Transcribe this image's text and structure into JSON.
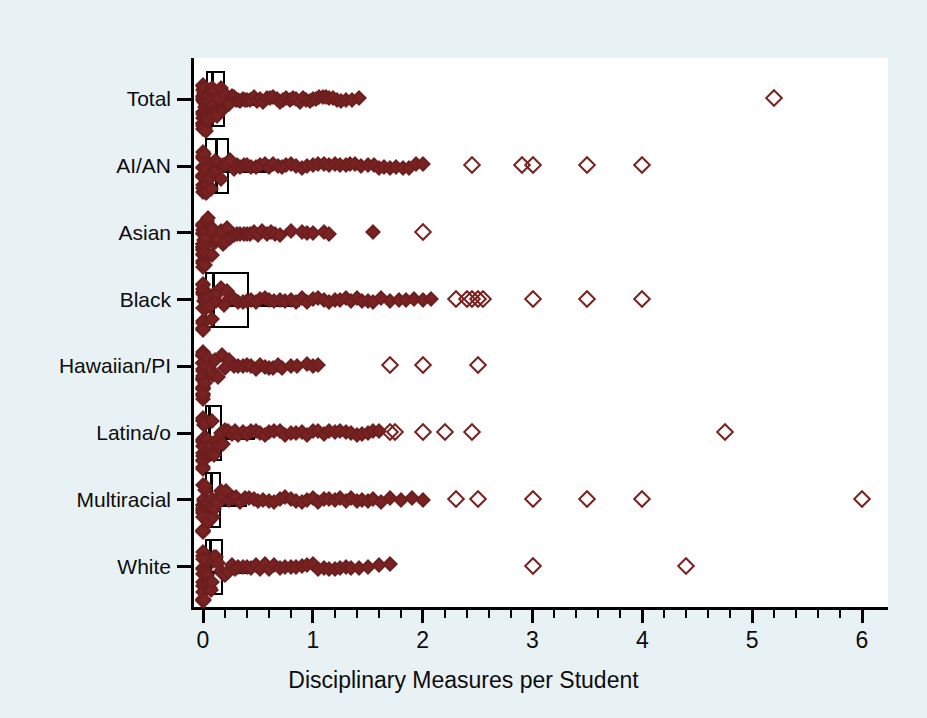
{
  "figure": {
    "background_color": "#e8f1f3",
    "panel_color": "#ffffff",
    "marker_color": "#7a2222",
    "axis_color": "#000000"
  },
  "chart_data": {
    "type": "box",
    "title": "",
    "subtitle": "",
    "xlabel": "Disciplinary Measures per Student",
    "ylabel": "",
    "xlim": [
      0,
      6
    ],
    "xticks": [
      0,
      1,
      2,
      3,
      4,
      5,
      6
    ],
    "xticklabels": [
      "0",
      "1",
      "2",
      "3",
      "4",
      "5",
      "6"
    ],
    "minor_tick_step": 0.2,
    "grid": false,
    "legend": null,
    "orientation": "horizontal",
    "categories": [
      "Total",
      "AI/AN",
      "Asian",
      "Black",
      "Hawaiian/PI",
      "Latina/o",
      "Multiracial",
      "White"
    ],
    "series": [
      {
        "name": "Total",
        "q1": 0.03,
        "median": 0.09,
        "q3": 0.2,
        "whisker_low": 0.0,
        "whisker_high": 0.46,
        "box_visible": true,
        "points": [
          0.0,
          0.0,
          0.0,
          0.0,
          0.0,
          0.0,
          0.0,
          0.0,
          0.0,
          0.0,
          0.0,
          0.0,
          0.0,
          0.0,
          0.01,
          0.01,
          0.01,
          0.01,
          0.01,
          0.01,
          0.02,
          0.02,
          0.02,
          0.02,
          0.03,
          0.03,
          0.03,
          0.03,
          0.04,
          0.04,
          0.04,
          0.05,
          0.05,
          0.05,
          0.06,
          0.06,
          0.07,
          0.07,
          0.08,
          0.08,
          0.09,
          0.09,
          0.1,
          0.1,
          0.11,
          0.12,
          0.13,
          0.14,
          0.15,
          0.16,
          0.17,
          0.18,
          0.19,
          0.2,
          0.21,
          0.22,
          0.24,
          0.26,
          0.28,
          0.3,
          0.32,
          0.34,
          0.36,
          0.38,
          0.4,
          0.43,
          0.46,
          0.49,
          0.52,
          0.55,
          0.58,
          0.61,
          0.64,
          0.67,
          0.7,
          0.73,
          0.76,
          0.79,
          0.82,
          0.85,
          0.88,
          0.91,
          0.94,
          0.97,
          1.0,
          1.03,
          1.06,
          1.09,
          1.12,
          1.15,
          1.18,
          1.22,
          1.26,
          1.3,
          1.36,
          1.42,
          5.2
        ],
        "outliers_far": [
          5.2
        ]
      },
      {
        "name": "AI/AN",
        "q1": 0.02,
        "median": 0.12,
        "q3": 0.24,
        "whisker_low": 0.0,
        "whisker_high": 0.62,
        "box_visible": true,
        "points": [
          0.0,
          0.0,
          0.0,
          0.0,
          0.0,
          0.0,
          0.0,
          0.0,
          0.0,
          0.0,
          0.0,
          0.0,
          0.01,
          0.01,
          0.01,
          0.02,
          0.02,
          0.03,
          0.03,
          0.04,
          0.05,
          0.06,
          0.07,
          0.08,
          0.09,
          0.1,
          0.11,
          0.12,
          0.14,
          0.16,
          0.18,
          0.2,
          0.22,
          0.25,
          0.28,
          0.31,
          0.34,
          0.37,
          0.4,
          0.44,
          0.48,
          0.52,
          0.56,
          0.6,
          0.64,
          0.68,
          0.72,
          0.76,
          0.8,
          0.85,
          0.9,
          0.95,
          1.0,
          1.05,
          1.1,
          1.15,
          1.2,
          1.25,
          1.3,
          1.34,
          1.38,
          1.44,
          1.5,
          1.56,
          1.6,
          1.65,
          1.7,
          1.76,
          1.82,
          1.88,
          1.94,
          2.0,
          2.45,
          2.9,
          3.0,
          3.5,
          4.0
        ],
        "outliers_far": [
          2.45,
          2.9,
          3.0,
          3.5,
          4.0
        ]
      },
      {
        "name": "Asian",
        "q1": 0.0,
        "median": 0.01,
        "q3": 0.03,
        "whisker_low": 0.0,
        "whisker_high": 0.07,
        "box_visible": false,
        "points": [
          0.0,
          0.0,
          0.0,
          0.0,
          0.0,
          0.0,
          0.0,
          0.0,
          0.0,
          0.0,
          0.0,
          0.0,
          0.0,
          0.0,
          0.0,
          0.0,
          0.0,
          0.01,
          0.01,
          0.01,
          0.01,
          0.02,
          0.02,
          0.03,
          0.04,
          0.05,
          0.06,
          0.07,
          0.08,
          0.09,
          0.1,
          0.12,
          0.14,
          0.16,
          0.18,
          0.2,
          0.22,
          0.25,
          0.28,
          0.31,
          0.34,
          0.37,
          0.4,
          0.43,
          0.46,
          0.5,
          0.54,
          0.58,
          0.62,
          0.66,
          0.7,
          0.8,
          0.9,
          0.95,
          1.0,
          1.1,
          1.15,
          1.55,
          2.0
        ],
        "outliers_far": [
          0.8,
          0.9,
          0.95,
          1.0,
          1.1,
          1.15,
          1.55,
          2.0
        ]
      },
      {
        "name": "Black",
        "q1": 0.02,
        "median": 0.1,
        "q3": 0.42,
        "whisker_low": 0.0,
        "whisker_high": 0.88,
        "box_visible": true,
        "points": [
          0.0,
          0.0,
          0.0,
          0.0,
          0.0,
          0.0,
          0.0,
          0.0,
          0.0,
          0.0,
          0.0,
          0.01,
          0.01,
          0.02,
          0.03,
          0.04,
          0.05,
          0.06,
          0.08,
          0.1,
          0.12,
          0.14,
          0.16,
          0.19,
          0.22,
          0.25,
          0.28,
          0.32,
          0.36,
          0.4,
          0.44,
          0.48,
          0.52,
          0.56,
          0.6,
          0.65,
          0.7,
          0.75,
          0.8,
          0.85,
          0.9,
          0.95,
          1.0,
          1.05,
          1.1,
          1.15,
          1.2,
          1.25,
          1.3,
          1.35,
          1.4,
          1.45,
          1.5,
          1.55,
          1.62,
          1.7,
          1.78,
          1.85,
          1.92,
          2.0,
          2.08,
          2.3,
          2.4,
          2.45,
          2.5,
          2.55,
          3.0,
          3.5,
          4.0
        ],
        "outliers_far": [
          2.3,
          2.4,
          2.45,
          2.5,
          2.55,
          3.0,
          3.5,
          4.0
        ]
      },
      {
        "name": "Hawaiian/PI",
        "q1": 0.0,
        "median": 0.0,
        "q3": 0.02,
        "whisker_low": 0.0,
        "whisker_high": 0.04,
        "box_visible": false,
        "points": [
          0.0,
          0.0,
          0.0,
          0.0,
          0.0,
          0.0,
          0.0,
          0.0,
          0.0,
          0.0,
          0.0,
          0.0,
          0.0,
          0.0,
          0.0,
          0.0,
          0.0,
          0.0,
          0.0,
          0.0,
          0.0,
          0.0,
          0.01,
          0.02,
          0.03,
          0.05,
          0.07,
          0.09,
          0.11,
          0.14,
          0.17,
          0.2,
          0.24,
          0.28,
          0.32,
          0.36,
          0.4,
          0.44,
          0.48,
          0.52,
          0.56,
          0.6,
          0.64,
          0.68,
          0.72,
          0.8,
          0.86,
          0.95,
          1.0,
          1.05,
          1.7,
          2.0,
          2.5
        ],
        "outliers_far": [
          0.8,
          0.86,
          0.95,
          1.0,
          1.05,
          1.7,
          2.0,
          2.5
        ]
      },
      {
        "name": "Latina/o",
        "q1": 0.02,
        "median": 0.06,
        "q3": 0.17,
        "whisker_low": 0.0,
        "whisker_high": 0.47,
        "box_visible": true,
        "points": [
          0.0,
          0.0,
          0.0,
          0.0,
          0.0,
          0.0,
          0.0,
          0.0,
          0.0,
          0.0,
          0.0,
          0.0,
          0.0,
          0.01,
          0.01,
          0.01,
          0.02,
          0.02,
          0.03,
          0.03,
          0.04,
          0.05,
          0.06,
          0.07,
          0.08,
          0.09,
          0.1,
          0.12,
          0.14,
          0.16,
          0.18,
          0.2,
          0.23,
          0.26,
          0.29,
          0.32,
          0.36,
          0.4,
          0.44,
          0.48,
          0.52,
          0.56,
          0.6,
          0.65,
          0.7,
          0.75,
          0.8,
          0.85,
          0.9,
          0.95,
          1.0,
          1.05,
          1.1,
          1.15,
          1.2,
          1.25,
          1.3,
          1.35,
          1.4,
          1.45,
          1.5,
          1.55,
          1.6,
          1.7,
          1.75,
          2.0,
          2.2,
          2.45,
          4.75
        ],
        "outliers_far": [
          1.7,
          1.75,
          2.0,
          2.2,
          2.45,
          4.75
        ]
      },
      {
        "name": "Multiracial",
        "q1": 0.02,
        "median": 0.08,
        "q3": 0.16,
        "whisker_low": 0.0,
        "whisker_high": 0.4,
        "box_visible": true,
        "points": [
          0.0,
          0.0,
          0.0,
          0.0,
          0.0,
          0.0,
          0.0,
          0.0,
          0.0,
          0.0,
          0.0,
          0.0,
          0.01,
          0.01,
          0.02,
          0.02,
          0.03,
          0.04,
          0.05,
          0.06,
          0.07,
          0.08,
          0.09,
          0.1,
          0.12,
          0.14,
          0.16,
          0.18,
          0.21,
          0.24,
          0.27,
          0.3,
          0.34,
          0.38,
          0.42,
          0.46,
          0.5,
          0.55,
          0.6,
          0.65,
          0.7,
          0.75,
          0.8,
          0.85,
          0.9,
          0.95,
          1.0,
          1.05,
          1.1,
          1.15,
          1.2,
          1.25,
          1.3,
          1.35,
          1.4,
          1.45,
          1.5,
          1.55,
          1.62,
          1.7,
          1.8,
          1.9,
          2.0,
          2.3,
          2.5,
          3.0,
          3.5,
          4.0,
          6.0
        ],
        "outliers_far": [
          2.3,
          2.5,
          3.0,
          3.5,
          4.0,
          6.0
        ]
      },
      {
        "name": "White",
        "q1": 0.02,
        "median": 0.07,
        "q3": 0.18,
        "whisker_low": 0.0,
        "whisker_high": 0.42,
        "box_visible": true,
        "points": [
          0.0,
          0.0,
          0.0,
          0.0,
          0.0,
          0.0,
          0.0,
          0.0,
          0.0,
          0.0,
          0.0,
          0.0,
          0.0,
          0.01,
          0.01,
          0.01,
          0.02,
          0.02,
          0.03,
          0.04,
          0.05,
          0.06,
          0.07,
          0.08,
          0.09,
          0.1,
          0.12,
          0.14,
          0.16,
          0.18,
          0.2,
          0.23,
          0.26,
          0.29,
          0.32,
          0.36,
          0.4,
          0.44,
          0.48,
          0.52,
          0.56,
          0.6,
          0.65,
          0.7,
          0.75,
          0.8,
          0.85,
          0.9,
          0.95,
          1.0,
          1.05,
          1.1,
          1.15,
          1.2,
          1.25,
          1.3,
          1.35,
          1.42,
          1.5,
          1.6,
          1.7,
          3.0,
          4.4
        ],
        "outliers_far": [
          3.0,
          4.4
        ]
      }
    ]
  }
}
